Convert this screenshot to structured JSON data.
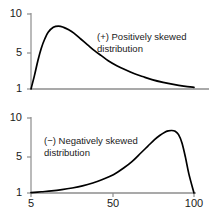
{
  "figure": {
    "background_color": "#ffffff",
    "curve_color": "#000000",
    "axis_color": "#8c8c8c",
    "text_color": "#1a1a1a"
  },
  "chart_data": [
    {
      "type": "line",
      "title": "",
      "subtitle": "",
      "xlabel": "",
      "ylabel": "",
      "annotation_line1": "(+) Positively skewed",
      "annotation_line2": "distribution",
      "annotation_position": "center-right",
      "grid": false,
      "legend": "none",
      "xlim": [
        5,
        100
      ],
      "ylim": [
        1,
        10
      ],
      "xticks": [
        5,
        50,
        100
      ],
      "xticklabels": [
        "",
        "",
        ""
      ],
      "yticks": [
        1,
        5,
        10
      ],
      "yticklabels": [
        "1",
        "5",
        "10"
      ],
      "x": [
        5,
        7,
        9,
        11,
        13,
        15,
        18,
        21,
        24,
        27,
        30,
        34,
        38,
        42,
        46,
        50,
        55,
        60,
        65,
        70,
        76,
        82,
        88,
        94,
        100
      ],
      "values": [
        1.0,
        2.6,
        4.4,
        5.9,
        7.0,
        7.8,
        8.4,
        8.55,
        8.4,
        8.1,
        7.7,
        7.0,
        6.3,
        5.6,
        5.0,
        4.4,
        3.8,
        3.3,
        2.85,
        2.5,
        2.1,
        1.8,
        1.55,
        1.35,
        1.2
      ]
    },
    {
      "type": "line",
      "title": "",
      "subtitle": "",
      "xlabel": "",
      "ylabel": "",
      "annotation_line1": "(−) Negatively skewed",
      "annotation_line2": "distribution",
      "annotation_position": "center-left",
      "grid": false,
      "legend": "none",
      "xlim": [
        5,
        100
      ],
      "ylim": [
        1,
        10
      ],
      "xticks": [
        5,
        50,
        100
      ],
      "xticklabels": [
        "5",
        "50",
        "100"
      ],
      "yticks": [
        1,
        5,
        10
      ],
      "yticklabels": [
        "1",
        "5",
        "10"
      ],
      "x": [
        5,
        11,
        17,
        23,
        29,
        35,
        41,
        47,
        53,
        59,
        64,
        69,
        73,
        77,
        80,
        83,
        85,
        87,
        89,
        91,
        93,
        95,
        97,
        100
      ],
      "values": [
        1.05,
        1.15,
        1.25,
        1.4,
        1.6,
        1.85,
        2.2,
        2.65,
        3.2,
        4.0,
        4.8,
        5.8,
        6.6,
        7.4,
        7.9,
        8.3,
        8.45,
        8.5,
        8.4,
        8.0,
        7.0,
        5.3,
        3.3,
        1.0
      ]
    }
  ],
  "panels": {
    "positive": {
      "ytick_top": "10",
      "ytick_mid": "5",
      "ytick_bottom": "1",
      "label_line1": "(+) Positively skewed",
      "label_line2": "distribution"
    },
    "negative": {
      "ytick_top": "10",
      "ytick_mid": "5",
      "ytick_bottom": "1",
      "label_line1": "(−) Negatively skewed",
      "label_line2": "distribution",
      "xtick_left": "5",
      "xtick_mid": "50",
      "xtick_right": "100"
    }
  }
}
